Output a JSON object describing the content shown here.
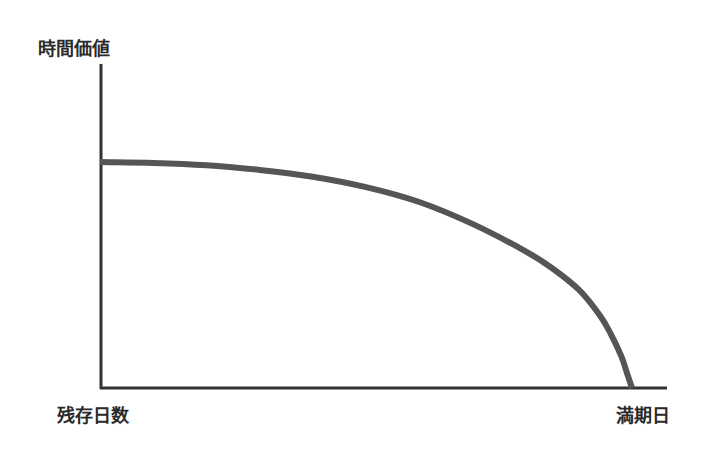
{
  "chart_data": {
    "type": "line",
    "title": "",
    "ylabel": "時間価値",
    "xlabel": "",
    "x_start_label": "残存日数",
    "x_end_label": "満期日",
    "grid": false,
    "legend": null,
    "x_range": [
      0,
      100
    ],
    "ylim": [
      0,
      100
    ],
    "series": [
      {
        "name": "時間価値",
        "color": "#555555",
        "x": [
          0,
          10,
          20,
          30,
          40,
          50,
          60,
          70,
          80,
          85,
          90,
          94,
          96,
          98,
          99,
          100
        ],
        "values": [
          100,
          99.6,
          98.6,
          96.5,
          93.5,
          88.9,
          82.3,
          72.6,
          60.5,
          53.0,
          43.5,
          32.0,
          24.0,
          14.0,
          7.0,
          0
        ]
      }
    ],
    "axis_color": "#333333"
  }
}
